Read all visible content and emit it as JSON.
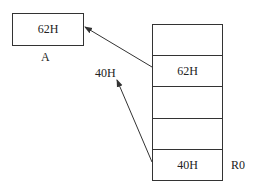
{
  "variable_box": {
    "value": "62H",
    "label": "A"
  },
  "memory_stack": {
    "cells": [
      {
        "value": ""
      },
      {
        "value": "62H"
      },
      {
        "value": ""
      },
      {
        "value": ""
      },
      {
        "value": "40H"
      }
    ],
    "register_label": "R0"
  },
  "pointer_label": "40H",
  "colors": {
    "line": "#333333",
    "background": "#ffffff"
  }
}
